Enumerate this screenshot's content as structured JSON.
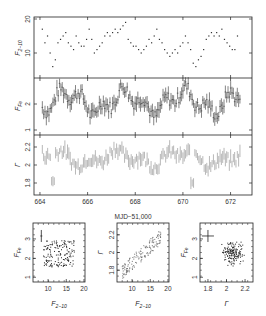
{
  "figure": {
    "xlabel": "MJD−51,000",
    "panels": {
      "flux_2_10": {
        "ylabel": "F",
        "ylabel_sub": "2−10",
        "yticks": [
          "10",
          "20"
        ]
      },
      "flux_ew": {
        "ylabel": "F",
        "ylabel_sub": "Fe",
        "yticks": [
          "1",
          "2"
        ]
      },
      "gamma": {
        "ylabel": "Γ",
        "yticks": [
          "1.8",
          "2",
          "2.2"
        ]
      },
      "xticks": [
        "664",
        "666",
        "668",
        "670",
        "672"
      ]
    },
    "scatter": [
      {
        "xlabel": "F",
        "xlabel_sub": "2−10",
        "ylabel": "F",
        "ylabel_sub": "Fe",
        "xticks": [
          "10",
          "15",
          "20"
        ],
        "yticks": [
          "1",
          "2",
          "3"
        ]
      },
      {
        "xlabel": "F",
        "xlabel_sub": "2−10",
        "ylabel": "Γ",
        "ylabel_sub": "",
        "xticks": [
          "10",
          "15",
          "20"
        ],
        "yticks": [
          "1.8",
          "2",
          "2.2"
        ]
      },
      {
        "xlabel": "Γ",
        "xlabel_sub": "",
        "ylabel": "F",
        "ylabel_sub": "Fe",
        "xticks": [
          "1.8",
          "2",
          "2.2"
        ],
        "yticks": [
          "1",
          "2",
          "3"
        ]
      }
    ]
  },
  "chart_data": [
    {
      "type": "scatter",
      "title": "",
      "xlabel": "MJD−51,000",
      "ylabel": "F2−10",
      "xlim": [
        663.5,
        673
      ],
      "ylim": [
        5,
        20
      ],
      "x": [
        664.1,
        664.2,
        664.3,
        664.4,
        664.5,
        664.6,
        664.7,
        664.8,
        664.9,
        665.0,
        665.1,
        665.2,
        665.3,
        665.4,
        665.5,
        665.6,
        665.7,
        665.8,
        665.9,
        666.0,
        666.1,
        666.2,
        666.3,
        666.4,
        666.5,
        666.6,
        666.7,
        666.8,
        666.9,
        667.0,
        667.1,
        667.2,
        667.3,
        667.4,
        667.5,
        667.6,
        667.7,
        667.8,
        667.9,
        668.0,
        668.1,
        668.2,
        668.3,
        668.4,
        668.5,
        668.6,
        668.7,
        668.8,
        668.9,
        669.0,
        669.1,
        669.2,
        669.3,
        669.4,
        669.5,
        669.6,
        669.7,
        669.8,
        669.9,
        670.0,
        670.1,
        670.2,
        670.3,
        670.4,
        670.5,
        670.6,
        670.7,
        670.8,
        670.9,
        671.0,
        671.1,
        671.2,
        671.3,
        671.4,
        671.5,
        671.6,
        671.7,
        671.8,
        671.9,
        672.0,
        672.1,
        672.2,
        672.3,
        672.4
      ],
      "values": [
        17,
        13,
        15,
        10,
        6,
        8,
        13,
        14,
        15,
        16,
        13,
        12,
        11,
        15,
        13,
        12,
        12,
        14,
        17,
        14,
        10,
        11,
        12,
        13,
        15,
        16,
        15,
        16,
        17,
        16,
        17,
        18,
        19,
        14,
        13,
        12,
        12,
        11,
        10,
        11,
        12,
        14,
        13,
        15,
        17,
        14,
        13,
        11,
        10,
        9,
        10,
        11,
        10,
        12,
        13,
        15,
        13,
        11,
        7,
        6,
        8,
        9,
        11,
        14,
        15,
        16,
        15,
        16,
        15,
        17,
        14,
        13,
        12,
        11,
        11,
        15
      ],
      "grid": false
    },
    {
      "type": "scatter",
      "xlabel": "MJD−51,000",
      "ylabel": "FFe",
      "xlim": [
        663.5,
        673
      ],
      "ylim": [
        0.9,
        3.1
      ],
      "note": "error bars on each point",
      "values_range": [
        1.0,
        2.9
      ]
    },
    {
      "type": "scatter",
      "xlabel": "MJD−51,000",
      "ylabel": "Γ",
      "xlim": [
        663.5,
        673
      ],
      "ylim": [
        1.7,
        2.3
      ],
      "note": "error bars on each point",
      "values_range": [
        1.72,
        2.28
      ]
    },
    {
      "type": "scatter",
      "xlabel": "F2−10",
      "ylabel": "FFe",
      "xlim": [
        6,
        20
      ],
      "ylim": [
        0.8,
        3.6
      ]
    },
    {
      "type": "scatter",
      "xlabel": "F2−10",
      "ylabel": "Γ",
      "xlim": [
        6,
        20
      ],
      "ylim": [
        1.7,
        2.3
      ]
    },
    {
      "type": "scatter",
      "xlabel": "Γ",
      "ylabel": "FFe",
      "xlim": [
        1.7,
        2.3
      ],
      "ylim": [
        0.8,
        3.6
      ]
    }
  ]
}
